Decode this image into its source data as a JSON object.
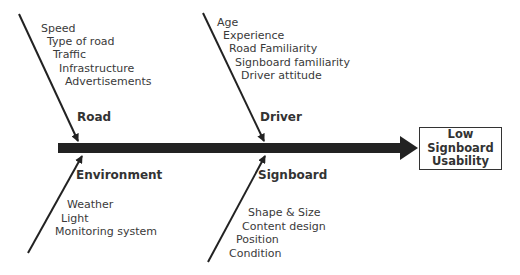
{
  "diagram": {
    "type": "fishbone",
    "effect": {
      "lines": [
        "Low",
        "Signboard",
        "Usability"
      ]
    },
    "categories": [
      {
        "name": "Road",
        "position": "top-left",
        "causes": [
          "Speed",
          "Type of road",
          "Traffic",
          "Infrastructure",
          "Advertisements"
        ]
      },
      {
        "name": "Driver",
        "position": "top-right",
        "causes": [
          "Age",
          "Experience",
          "Road Familiarity",
          "Signboard familiarity",
          "Driver attitude"
        ]
      },
      {
        "name": "Environment",
        "position": "bottom-left",
        "causes": [
          "Weather",
          "Light",
          "Monitoring system"
        ]
      },
      {
        "name": "Signboard",
        "position": "bottom-right",
        "causes": [
          "Shape & Size",
          "Content design",
          "Position",
          "Condition"
        ]
      }
    ],
    "colors": {
      "line": "#222222",
      "text": "#333333",
      "background": "#ffffff"
    }
  }
}
